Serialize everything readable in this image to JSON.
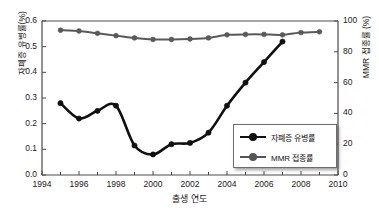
{
  "chart_data": {
    "type": "line",
    "title": "",
    "xlabel": "출생 연도",
    "ylabel": "자폐증 유병률(%)",
    "ylabel_right": "MMR 접종률 (%)",
    "xlim": [
      1994,
      2010
    ],
    "ylim": [
      0.0,
      0.6
    ],
    "ylim_right": [
      0,
      100
    ],
    "grid": false,
    "legend_position": "lower-right",
    "xticks": [
      "1994",
      "1996",
      "1998",
      "2000",
      "2002",
      "2004",
      "2006",
      "2008",
      "2010"
    ],
    "xtick_values": [
      1994,
      1996,
      1998,
      2000,
      2002,
      2004,
      2006,
      2008,
      2010
    ],
    "yticks_left": [
      "0.0",
      "0.1",
      "0.2",
      "0.3",
      "0.4",
      "0.5",
      "0.6"
    ],
    "ytick_values_left": [
      0.0,
      0.1,
      0.2,
      0.3,
      0.4,
      0.5,
      0.6
    ],
    "yticks_right": [
      "0",
      "20",
      "40",
      "60",
      "80",
      "100"
    ],
    "ytick_values_right": [
      0,
      20,
      40,
      60,
      80,
      100
    ],
    "series": [
      {
        "name": "자폐증 유병률",
        "axis": "left",
        "color": "#101010",
        "marker": "circle",
        "x": [
          1995,
          1996,
          1997,
          1998,
          1999,
          2000,
          2001,
          2002,
          2003,
          2004,
          2005,
          2006,
          2007
        ],
        "values": [
          0.28,
          0.22,
          0.25,
          0.27,
          0.115,
          0.08,
          0.12,
          0.125,
          0.165,
          0.27,
          0.36,
          0.44,
          0.52
        ]
      },
      {
        "name": "MMR 접종률",
        "axis": "right",
        "color": "#595959",
        "marker": "circle",
        "x": [
          1995,
          1996,
          1997,
          1998,
          1999,
          2000,
          2001,
          2002,
          2003,
          2004,
          2005,
          2006,
          2007,
          2008,
          2009
        ],
        "values": [
          94.0,
          93.5,
          92.0,
          90.5,
          89.0,
          88.0,
          88.0,
          88.3,
          89.0,
          91.0,
          91.3,
          91.3,
          91.0,
          92.5,
          93.0
        ]
      }
    ]
  },
  "legend": {
    "items": [
      {
        "label": "자폐증 유병률"
      },
      {
        "label": "MMR 접종률"
      }
    ]
  },
  "axes": {
    "frame_color": "#4a4a4a"
  }
}
